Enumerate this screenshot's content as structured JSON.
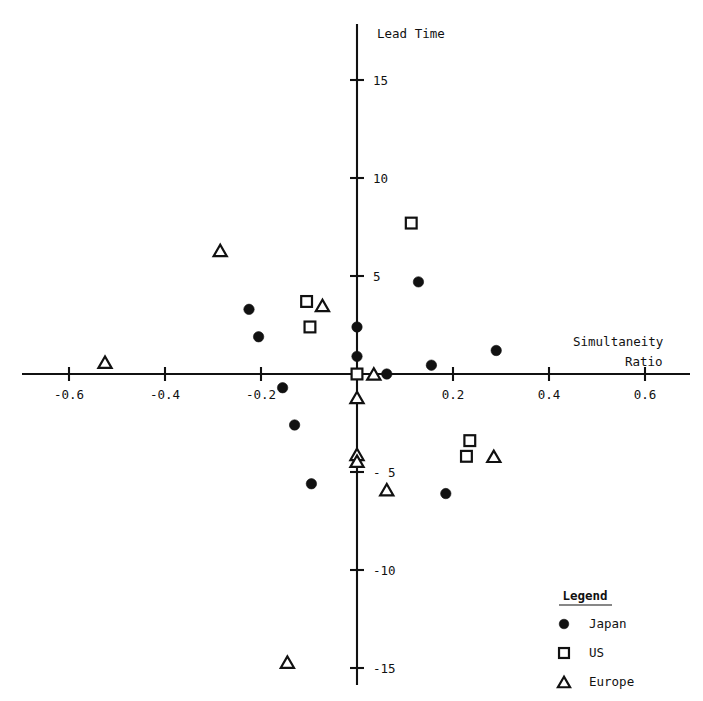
{
  "chart_data": {
    "type": "scatter",
    "title": "",
    "xlabel": "Simultaneity Ratio",
    "ylabel": "Lead Time",
    "xlim": [
      -0.7,
      0.68
    ],
    "ylim": [
      -16.5,
      16.8
    ],
    "grid": false,
    "legend_position": "bottom-right",
    "xticks": [
      -0.6,
      -0.4,
      -0.2,
      0.2,
      0.4,
      0.6
    ],
    "xtick_labels": [
      "-0.6",
      "-0.4",
      "-0.2",
      "0.2",
      "0.4",
      "0.6"
    ],
    "yticks": [
      15,
      10,
      5,
      -5,
      -10,
      -15
    ],
    "ytick_labels": [
      "15",
      "10",
      "5",
      "- 5",
      "-10",
      "-15"
    ],
    "series": [
      {
        "name": "Japan",
        "marker": "filled-circle",
        "color": "#111111",
        "points": [
          [
            -0.205,
            1.9
          ],
          [
            -0.225,
            3.3
          ],
          [
            -0.155,
            -0.7
          ],
          [
            -0.13,
            -2.6
          ],
          [
            -0.095,
            -5.6
          ],
          [
            0.0,
            2.4
          ],
          [
            0.0,
            0.9
          ],
          [
            0.062,
            0.0
          ],
          [
            0.128,
            4.7
          ],
          [
            0.155,
            0.45
          ],
          [
            0.185,
            -6.1
          ],
          [
            0.29,
            1.2
          ]
        ]
      },
      {
        "name": "US",
        "marker": "open-square",
        "color": "#111111",
        "points": [
          [
            -0.105,
            3.7
          ],
          [
            -0.098,
            2.4
          ],
          [
            0.0,
            0.0
          ],
          [
            0.113,
            7.7
          ],
          [
            0.235,
            -3.4
          ],
          [
            0.228,
            -4.2
          ]
        ]
      },
      {
        "name": "Europe",
        "marker": "open-triangle",
        "color": "#111111",
        "points": [
          [
            -0.525,
            0.6
          ],
          [
            -0.285,
            6.3
          ],
          [
            -0.072,
            3.5
          ],
          [
            0.0,
            -1.2
          ],
          [
            0.0,
            -4.1
          ],
          [
            0.0,
            -4.45
          ],
          [
            0.035,
            0.0
          ],
          [
            0.062,
            -5.9
          ],
          [
            0.285,
            -4.2
          ],
          [
            -0.145,
            -14.7
          ]
        ]
      }
    ]
  },
  "axes": {
    "y_axis_title": "Lead Time",
    "x_axis_title_line1": "Simultaneity",
    "x_axis_title_line2": "Ratio"
  },
  "legend": {
    "title": "Legend",
    "entries": [
      {
        "label": "Japan",
        "marker": "filled-circle"
      },
      {
        "label": "US",
        "marker": "open-square"
      },
      {
        "label": "Europe",
        "marker": "open-triangle"
      }
    ]
  }
}
